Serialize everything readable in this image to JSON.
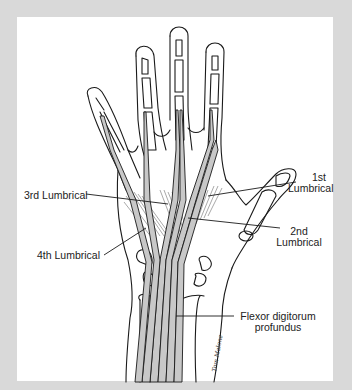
{
  "figure": {
    "colors": {
      "frame": "#d9d9d9",
      "panel": "#ffffff",
      "line": "#1a1a1a",
      "tendon_fill": "#c8c8c8",
      "muscle": "#7a7a7a"
    },
    "labels": {
      "third_lumbrical": "3rd Lumbrical",
      "fourth_lumbrical": "4th Lumbrical",
      "first_lumbrical_line1": "1st",
      "first_lumbrical_line2": "Lumbrical",
      "second_lumbrical_line1": "2nd",
      "second_lumbrical_line2": "Lumbrical",
      "fdp_line1": "Flexor digitorum",
      "fdp_line2": "profundus"
    },
    "signature": "Tom Malone"
  }
}
